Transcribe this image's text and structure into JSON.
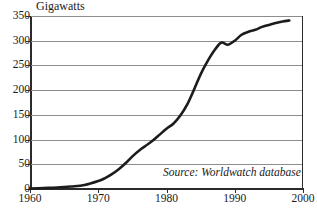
{
  "chart_data": {
    "type": "line",
    "title": "",
    "ylabel": "Gigawatts",
    "xlabel": "",
    "xlim": [
      1960,
      2000
    ],
    "ylim": [
      0,
      350
    ],
    "grid": true,
    "legend": null,
    "yticks": [
      0,
      50,
      100,
      150,
      200,
      250,
      300,
      350
    ],
    "ytick_labels": [
      "0",
      "50",
      "100",
      "150",
      "200",
      "250",
      "300",
      "350"
    ],
    "xticks": [
      1960,
      1970,
      1980,
      1990,
      2000
    ],
    "xtick_labels": [
      "1960",
      "1970",
      "1980",
      "1990",
      "2000"
    ],
    "annotations": [
      {
        "text": "Source: Worldwatch database",
        "style": "italic",
        "x": 1983,
        "y": 28
      }
    ],
    "series": [
      {
        "name": "Installed nuclear capacity",
        "units": "Gigawatts",
        "color": "#1c1c1c",
        "x": [
          1960,
          1962,
          1964,
          1966,
          1968,
          1970,
          1971,
          1972,
          1973,
          1974,
          1975,
          1976,
          1977,
          1978,
          1979,
          1980,
          1981,
          1982,
          1983,
          1984,
          1985,
          1986,
          1987,
          1988,
          1989,
          1990,
          1991,
          1992,
          1993,
          1994,
          1995,
          1996,
          1997,
          1998
        ],
        "values": [
          1,
          2,
          3,
          5,
          8,
          16,
          22,
          30,
          40,
          52,
          66,
          78,
          88,
          98,
          110,
          122,
          132,
          148,
          170,
          200,
          232,
          258,
          280,
          296,
          292,
          300,
          312,
          318,
          322,
          328,
          332,
          336,
          339,
          341
        ]
      }
    ]
  },
  "colors": {
    "axis": "#2b2b2b",
    "grid": "#8d8d8d",
    "line": "#1c1c1c",
    "background": "#ffffff",
    "text": "#1a1a1a"
  }
}
